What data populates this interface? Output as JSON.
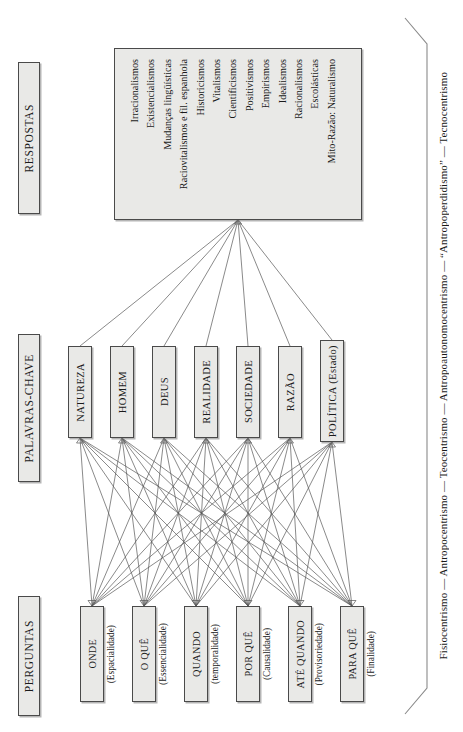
{
  "tiers": {
    "respostas_label": "RESPOSTAS",
    "palavras_label": "PALAVRAS-CHAVE",
    "perguntas_label": "PERGUNTAS"
  },
  "respostas": {
    "items": [
      "Mito-Razão: Naturalismo",
      "Escolásticas",
      "Racionalismos",
      "Idealismos",
      "Empirismos",
      "Positivismos",
      "Cientificismos",
      "Vitalismos",
      "Historicismos",
      "Raciovitalismos e fil. espanhola",
      "Mudanças lingüísticas",
      "Existencialismos",
      "Irracionalismos"
    ]
  },
  "palavras_chave": {
    "items": [
      "NATUREZA",
      "HOMEM",
      "DEUS",
      "REALIDADE",
      "SOCIEDADE",
      "RAZÃO",
      "POLÍTICA (Estado)"
    ]
  },
  "perguntas": {
    "items": [
      {
        "main": "ONDE",
        "sub": "(Espacialidade)"
      },
      {
        "main": "O QUÊ",
        "sub": "(Essencialidade)"
      },
      {
        "main": "QUANDO",
        "sub": "(temporalidade)"
      },
      {
        "main": "POR QUÊ",
        "sub": "(Causalidade)"
      },
      {
        "main": "ATÉ QUANDO",
        "sub": "(Provisoriedade)"
      },
      {
        "main": "PARA QUÊ",
        "sub": "(Finalidade)"
      }
    ]
  },
  "caption": {
    "text": "Fisiocentrismo — Antropocentrismo — Teocentrismo — Antropoautonomocentrismo — “Antropoperdidismo” — Tecnocentrismo"
  },
  "colors": {
    "box_fill": "#e9e9e7",
    "box_border": "#4a4a4a",
    "line": "#585858",
    "bracket": "#8a8a8a",
    "background": "#ffffff",
    "text": "#1a1a1a"
  }
}
